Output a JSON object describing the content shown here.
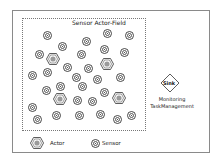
{
  "diagram": {
    "field_title": "Sensor Actor-Field",
    "sink_label": "Sink",
    "monitoring_line1": "Monitoring",
    "monitoring_line2": "TaskManagement",
    "legend": {
      "actor_label": "Actor",
      "sensor_label": "Sensor"
    },
    "sensors": [
      [
        47,
        35
      ],
      [
        107,
        33
      ],
      [
        129,
        35
      ],
      [
        62,
        46
      ],
      [
        86,
        41
      ],
      [
        104,
        49
      ],
      [
        39,
        54
      ],
      [
        81,
        54
      ],
      [
        124,
        52
      ],
      [
        32,
        75
      ],
      [
        47,
        72
      ],
      [
        67,
        67
      ],
      [
        88,
        68
      ],
      [
        76,
        77
      ],
      [
        97,
        79
      ],
      [
        120,
        77
      ],
      [
        46,
        90
      ],
      [
        60,
        86
      ],
      [
        82,
        86
      ],
      [
        104,
        92
      ],
      [
        77,
        100
      ],
      [
        92,
        101
      ],
      [
        32,
        107
      ],
      [
        37,
        119
      ],
      [
        56,
        115
      ],
      [
        79,
        115
      ],
      [
        100,
        114
      ],
      [
        117,
        119
      ],
      [
        131,
        115
      ]
    ],
    "actors": [
      [
        53,
        59
      ],
      [
        107,
        64
      ],
      [
        60,
        99
      ],
      [
        119,
        98
      ]
    ],
    "colors": {
      "stroke": "#333333",
      "actor_fill": "#9a9a9a",
      "border": "#8a8a8a"
    }
  }
}
